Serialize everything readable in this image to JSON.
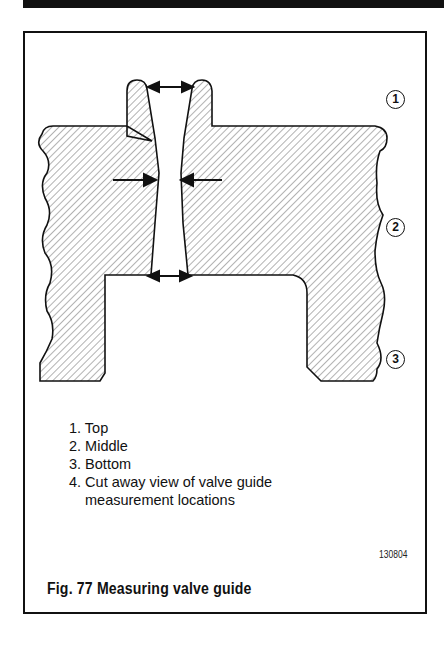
{
  "figure": {
    "number_label": "Fig. 77",
    "caption": "Fig. 77  Measuring valve guide",
    "reference_code": "130804",
    "callouts": [
      "1",
      "2",
      "3"
    ],
    "legend": [
      {
        "text": "1. Top"
      },
      {
        "text": "2. Middle"
      },
      {
        "text": "3. Bottom"
      },
      {
        "text": "4. Cut away view of valve guide",
        "continuation": "measurement locations"
      }
    ],
    "colors": {
      "ink": "#111111",
      "hatch": "#555555",
      "paper": "#ffffff"
    }
  }
}
